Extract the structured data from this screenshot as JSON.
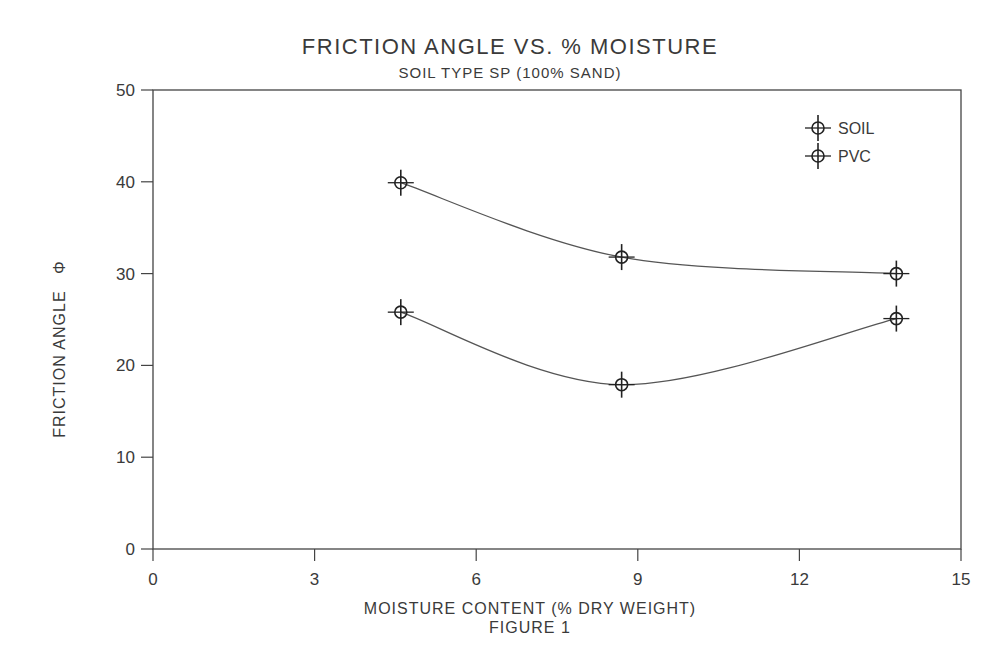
{
  "chart_data": {
    "type": "line",
    "title": "FRICTION ANGLE VS. % MOISTURE",
    "subtitle": "SOIL TYPE SP (100% SAND)",
    "xlabel": "MOISTURE CONTENT (% DRY WEIGHT)",
    "ylabel": "FRICTION ANGLE",
    "ylabel_symbol": "Φ",
    "caption": "FIGURE 1",
    "xlim": [
      0,
      15
    ],
    "ylim": [
      0,
      50
    ],
    "xticks": [
      0,
      3,
      6,
      9,
      12,
      15
    ],
    "yticks": [
      0,
      10,
      20,
      30,
      40,
      50
    ],
    "grid": false,
    "legend_position": "top-right",
    "series": [
      {
        "name": "SOIL",
        "x": [
          4.6,
          8.7,
          13.8
        ],
        "y": [
          39.9,
          31.8,
          30.0
        ]
      },
      {
        "name": "PVC",
        "x": [
          4.6,
          8.7,
          13.8
        ],
        "y": [
          25.8,
          17.9,
          25.1
        ]
      }
    ]
  },
  "legend": {
    "items": [
      "SOIL",
      "PVC"
    ]
  }
}
